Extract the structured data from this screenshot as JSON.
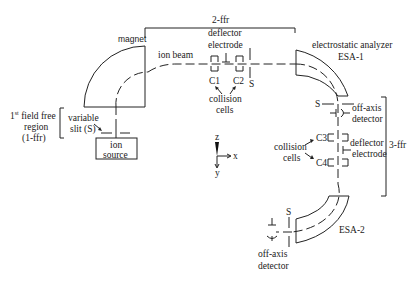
{
  "diagram": {
    "labels": {
      "magnet": "magnet",
      "ion_beam": "ion beam",
      "ffr2": "2-ffr",
      "deflector1_line1": "deflector",
      "deflector1_line2": "electrode",
      "c1": "C1",
      "c2": "C2",
      "slit_top": "S",
      "collision1_line1": "collision",
      "collision1_line2": "cells",
      "esa1_line1": "electrostatic analyzer",
      "esa1_line2": "ESA-1",
      "slit_esa1": "S",
      "offaxis1_line1": "off-axis",
      "offaxis1_line2": "detector",
      "c3": "C3",
      "c4": "C4",
      "collision2_line1": "collision",
      "collision2_line2": "cells",
      "deflector2_line1": "deflector",
      "deflector2_line2": "electrode",
      "ffr3": "3-ffr",
      "ffr1_line1_pre": "1",
      "ffr1_line1_sup": "st",
      "ffr1_line1_post": " field free",
      "ffr1_line2": "region",
      "ffr1_line3": "(1-ffr)",
      "varslit_line1": "variable",
      "varslit_line2": "slit (S)",
      "source_line1": "ion",
      "source_line2": "source",
      "esa2": "ESA-2",
      "slit_esa2": "S",
      "offaxis2_line1": "off-axis",
      "offaxis2_line2": "detector",
      "axis_z": "z",
      "axis_x": "x",
      "axis_y": "y"
    }
  }
}
